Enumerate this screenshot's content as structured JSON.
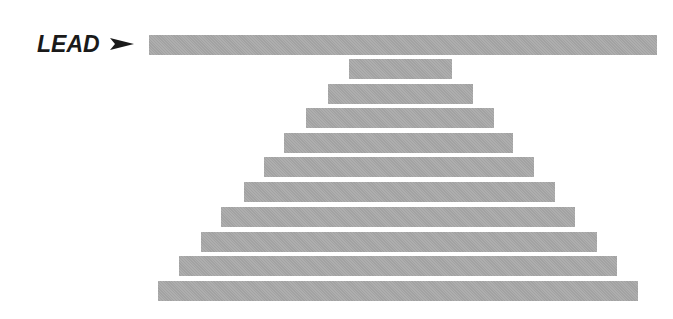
{
  "diagram": {
    "label": "LEAD",
    "arrow_icon": "right-arrowhead-icon",
    "bar_color": "#a9a9a9",
    "text_color": "#1a1a1a",
    "bars": [
      {
        "id": "lead",
        "left": 149,
        "right": 657,
        "top": 35
      },
      {
        "id": "level-1",
        "left": 349,
        "right": 452,
        "top": 59
      },
      {
        "id": "level-2",
        "left": 328,
        "right": 473,
        "top": 84
      },
      {
        "id": "level-3",
        "left": 306,
        "right": 494,
        "top": 108
      },
      {
        "id": "level-4",
        "left": 284,
        "right": 513,
        "top": 133
      },
      {
        "id": "level-5",
        "left": 264,
        "right": 534,
        "top": 157
      },
      {
        "id": "level-6",
        "left": 244,
        "right": 555,
        "top": 182
      },
      {
        "id": "level-7",
        "left": 221,
        "right": 575,
        "top": 207
      },
      {
        "id": "level-8",
        "left": 201,
        "right": 597,
        "top": 232
      },
      {
        "id": "level-9",
        "left": 179,
        "right": 617,
        "top": 256
      },
      {
        "id": "level-10",
        "left": 158,
        "right": 638,
        "top": 281
      }
    ]
  }
}
